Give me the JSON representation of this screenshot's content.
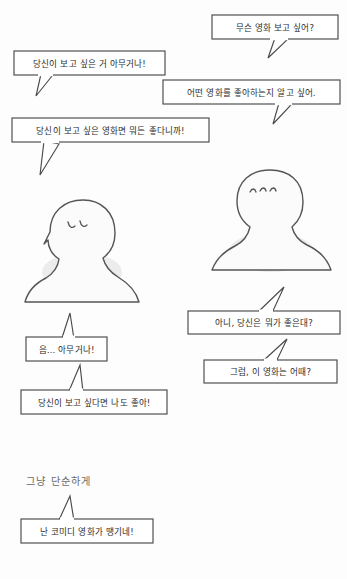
{
  "page": {
    "background_color": "#fdfdfd",
    "ink_color": "#4a4a4a",
    "text_color": "#2b2b2b",
    "caption_color": "#6a6a6a",
    "width": 347,
    "height": 579
  },
  "characters": [
    {
      "id": "left-character",
      "name": "left-character",
      "facing": "right",
      "expression": "closed-downcast-eyes",
      "marks": "two-curved-eyelashes"
    },
    {
      "id": "right-character",
      "name": "right-character",
      "facing": "left",
      "expression": "annoyed-brows",
      "marks": "three-curved-strokes"
    }
  ],
  "bubbles": [
    {
      "id": "bubble-1",
      "speaker": "right-character",
      "text": "무슨 영화 보고 싶어?",
      "tail": "down-left",
      "align": "right"
    },
    {
      "id": "bubble-2",
      "speaker": "left-character",
      "text": "당신이 보고 싶은 거 아무거나!",
      "tail": "down-left",
      "align": "left"
    },
    {
      "id": "bubble-3",
      "speaker": "right-character",
      "text": "어떤 영화를 좋아하는지 알고 싶어.",
      "tail": "down-left",
      "align": "right"
    },
    {
      "id": "bubble-4",
      "speaker": "left-character",
      "text": "당신이 보고 싶은 영화면 뭐든 좋다니까!",
      "tail": "down-left",
      "align": "left"
    },
    {
      "id": "bubble-5",
      "speaker": "left-character",
      "text": "음… 아무거나!",
      "tail": "up-right",
      "align": "left"
    },
    {
      "id": "bubble-6",
      "speaker": "right-character",
      "text": "아니, 당신은 뭐가 좋은대?",
      "tail": "up-right",
      "align": "right"
    },
    {
      "id": "bubble-7",
      "speaker": "right-character",
      "text": "그럼, 이 영화는 어때?",
      "tail": "up-right",
      "align": "right"
    },
    {
      "id": "bubble-8",
      "speaker": "left-character",
      "text": "당신이 보고 싶다면 나도 좋아!",
      "tail": "up-right",
      "align": "left"
    },
    {
      "id": "bubble-9",
      "speaker": "left-character",
      "text": "난 코미디 영화가 땡기네!",
      "tail": "up-right",
      "align": "left"
    }
  ],
  "captions": [
    {
      "id": "caption-simple",
      "text": "그냥 단순하게"
    }
  ]
}
